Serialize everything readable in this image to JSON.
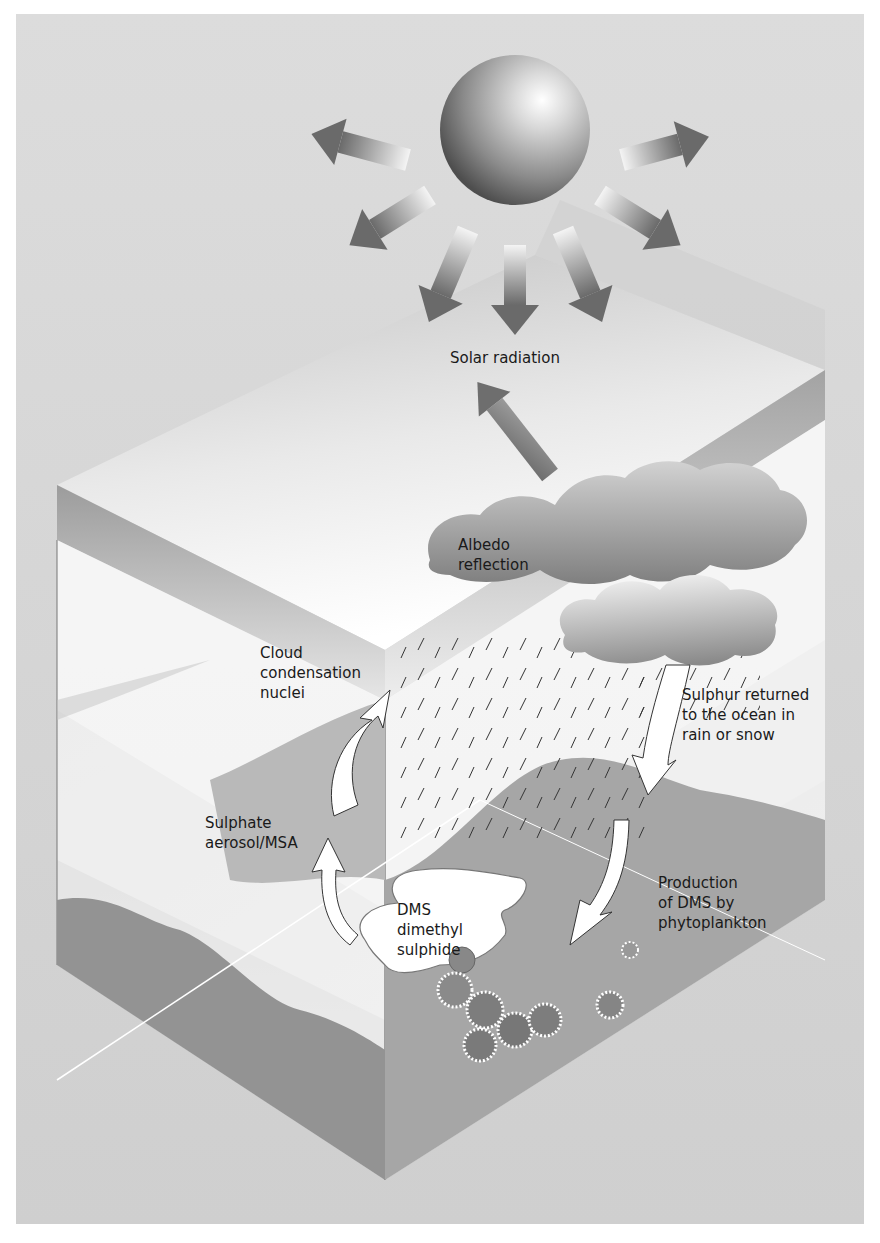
{
  "diagram": {
    "type": "process-cycle",
    "colors": {
      "page_background": "#ffffff",
      "sky_background": "#d9d9d9",
      "sun_light": "#f2f2f2",
      "sun_dark": "#5a5a5a",
      "arrow_dark": "#6b6b6b",
      "cloud_light": "#d0d0d0",
      "cloud_dark": "#8a8a8a",
      "sea_dark": "#8f8f8f",
      "sea_mid": "#a8a8a8",
      "box_face": "#ffffff",
      "text": "#1a1a1a"
    },
    "nodes": [
      {
        "id": "sun",
        "label": "",
        "icon": "sun-sphere-icon"
      },
      {
        "id": "solar",
        "label": "Solar radiation"
      },
      {
        "id": "albedo",
        "lines": [
          "Albedo",
          "reflection"
        ]
      },
      {
        "id": "ccn",
        "lines": [
          "Cloud",
          "condensation",
          "nuclei"
        ]
      },
      {
        "id": "sulphur_return",
        "lines": [
          "Sulphur returned",
          "to the ocean in",
          "rain or snow"
        ]
      },
      {
        "id": "sulphate",
        "lines": [
          "Sulphate",
          "aerosol/MSA"
        ]
      },
      {
        "id": "dms",
        "lines": [
          "DMS",
          "dimethyl",
          "sulphide"
        ]
      },
      {
        "id": "production",
        "lines": [
          "Production",
          "of DMS by",
          "phytoplankton"
        ]
      }
    ],
    "edges": [
      {
        "from": "sun",
        "to": "surroundings",
        "label": "Solar radiation",
        "count": 9
      },
      {
        "from": "clouds",
        "to": "space",
        "label": "Albedo reflection"
      },
      {
        "from": "sulphate",
        "to": "ccn",
        "label": ""
      },
      {
        "from": "dms",
        "to": "sulphate",
        "label": ""
      },
      {
        "from": "clouds",
        "to": "ocean",
        "label": "Sulphur returned to the ocean in rain or snow"
      },
      {
        "from": "ocean",
        "to": "phytoplankton",
        "label": "Production of DMS by phytoplankton"
      }
    ]
  }
}
